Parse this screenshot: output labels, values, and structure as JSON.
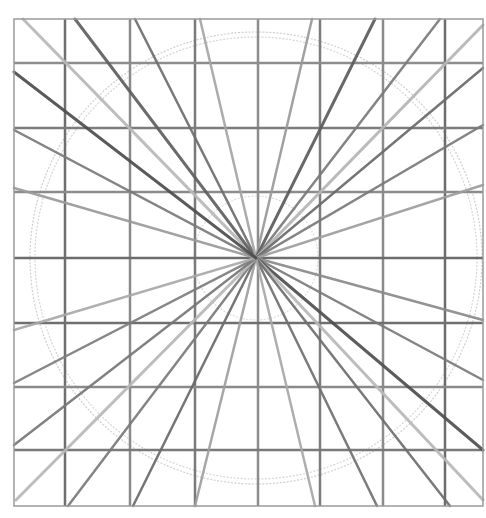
{
  "frame": {
    "x1": 14,
    "y1": 19,
    "x2": 483,
    "y2": 506,
    "color": "#9a9a9a"
  },
  "center": {
    "x": 256,
    "y": 258
  },
  "grid": {
    "vertical_x": [
      65,
      130,
      195,
      258,
      320,
      383,
      445
    ],
    "horizontal_y": [
      63,
      128,
      192,
      258,
      323,
      387,
      450
    ],
    "colors": [
      "#6f6f6f",
      "#8a8a8a",
      "#7a7a7a",
      "#8d8d8d",
      "#7c7c7c",
      "#8b8b8b",
      "#6c6c6c"
    ]
  },
  "circles": [
    {
      "r": 226,
      "color": "#cfcfcf"
    },
    {
      "r": 221,
      "color": "#d6d6d6"
    },
    {
      "r": 62,
      "color": "#dcdcdc"
    }
  ],
  "rays": [
    {
      "x": 23,
      "y": 19,
      "color": "#b8b8b8",
      "w": 3
    },
    {
      "x": 75,
      "y": 19,
      "color": "#5f5f5f",
      "w": 3
    },
    {
      "x": 135,
      "y": 19,
      "color": "#6e6e6e",
      "w": 2.5
    },
    {
      "x": 200,
      "y": 19,
      "color": "#a5a5a5",
      "w": 2.5
    },
    {
      "x": 312,
      "y": 19,
      "color": "#9a9a9a",
      "w": 2.5
    },
    {
      "x": 375,
      "y": 19,
      "color": "#5c5c5c",
      "w": 3
    },
    {
      "x": 440,
      "y": 19,
      "color": "#7a7a7a",
      "w": 2.5
    },
    {
      "x": 483,
      "y": 25,
      "color": "#b5b5b5",
      "w": 3
    },
    {
      "x": 483,
      "y": 68,
      "color": "#6a6a6a",
      "w": 2.5
    },
    {
      "x": 483,
      "y": 125,
      "color": "#7a7a7a",
      "w": 2.5
    },
    {
      "x": 483,
      "y": 185,
      "color": "#9e9e9e",
      "w": 2.5
    },
    {
      "x": 483,
      "y": 320,
      "color": "#8a8a8a",
      "w": 2.5
    },
    {
      "x": 483,
      "y": 380,
      "color": "#7a7a7a",
      "w": 2.5
    },
    {
      "x": 483,
      "y": 450,
      "color": "#4f4f4f",
      "w": 3
    },
    {
      "x": 483,
      "y": 500,
      "color": "#b8b8b8",
      "w": 3
    },
    {
      "x": 450,
      "y": 506,
      "color": "#6e6e6e",
      "w": 2.5
    },
    {
      "x": 377,
      "y": 506,
      "color": "#707070",
      "w": 2.5
    },
    {
      "x": 315,
      "y": 506,
      "color": "#a8a8a8",
      "w": 2.5
    },
    {
      "x": 195,
      "y": 506,
      "color": "#9f9f9f",
      "w": 2.5
    },
    {
      "x": 133,
      "y": 506,
      "color": "#6a6a6a",
      "w": 2.5
    },
    {
      "x": 68,
      "y": 506,
      "color": "#7a7a7a",
      "w": 2.5
    },
    {
      "x": 16,
      "y": 500,
      "color": "#b8b8b8",
      "w": 3
    },
    {
      "x": 14,
      "y": 445,
      "color": "#777777",
      "w": 2.5
    },
    {
      "x": 14,
      "y": 383,
      "color": "#7d7d7d",
      "w": 2.5
    },
    {
      "x": 14,
      "y": 330,
      "color": "#a9a9a9",
      "w": 2.5
    },
    {
      "x": 14,
      "y": 188,
      "color": "#9a9a9a",
      "w": 2.5
    },
    {
      "x": 14,
      "y": 130,
      "color": "#7a7a7a",
      "w": 2.5
    },
    {
      "x": 14,
      "y": 72,
      "color": "#4d4d4d",
      "w": 3
    }
  ]
}
